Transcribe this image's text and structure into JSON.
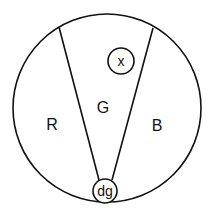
{
  "diagram": {
    "regions": [
      {
        "label": "R"
      },
      {
        "label": "G"
      },
      {
        "label": "B"
      }
    ],
    "nodes": [
      {
        "label": "x"
      },
      {
        "label": "dg"
      }
    ],
    "colors": {
      "stroke": "#111111",
      "background": "#ffffff"
    }
  }
}
